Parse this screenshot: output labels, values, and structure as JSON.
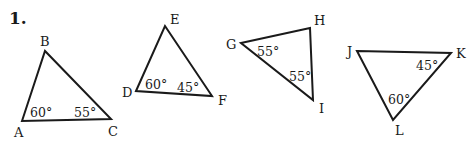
{
  "problem": {
    "number": "1."
  },
  "colors": {
    "ink": "#1a1a1a",
    "background": "#ffffff"
  },
  "triangles": [
    {
      "name": "ABC",
      "vertices": [
        {
          "label": "A",
          "x": 22,
          "y": 121
        },
        {
          "label": "B",
          "x": 45,
          "y": 51
        },
        {
          "label": "C",
          "x": 111,
          "y": 119
        }
      ],
      "angles": [
        {
          "vertex": "A",
          "value": "60°"
        },
        {
          "vertex": "C",
          "value": "55°"
        }
      ]
    },
    {
      "name": "DEF",
      "vertices": [
        {
          "label": "D",
          "x": 136,
          "y": 91
        },
        {
          "label": "E",
          "x": 165,
          "y": 26
        },
        {
          "label": "F",
          "x": 212,
          "y": 96
        }
      ],
      "angles": [
        {
          "vertex": "D",
          "value": "60°"
        },
        {
          "vertex": "F",
          "value": "45°"
        }
      ]
    },
    {
      "name": "GHI",
      "vertices": [
        {
          "label": "G",
          "x": 241,
          "y": 43
        },
        {
          "label": "H",
          "x": 310,
          "y": 28
        },
        {
          "label": "I",
          "x": 313,
          "y": 100
        }
      ],
      "angles": [
        {
          "vertex": "G",
          "value": "55°"
        },
        {
          "vertex": "I",
          "value": "55°"
        }
      ]
    },
    {
      "name": "JKL",
      "vertices": [
        {
          "label": "J",
          "x": 357,
          "y": 51
        },
        {
          "label": "K",
          "x": 451,
          "y": 53
        },
        {
          "label": "L",
          "x": 393,
          "y": 120
        }
      ],
      "angles": [
        {
          "vertex": "K",
          "value": "45°"
        },
        {
          "vertex": "L",
          "value": "60°"
        }
      ]
    }
  ]
}
